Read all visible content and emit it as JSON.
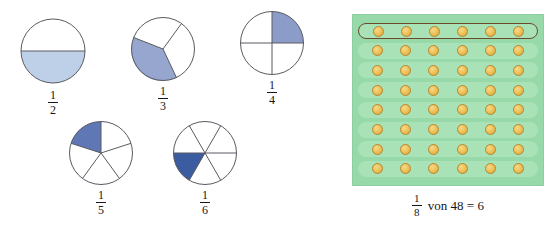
{
  "colors": {
    "fill_light_blue": "#bed0e8",
    "fill_mid_blue": "#8c9cc8",
    "fill_medium_blue": "#97a6cf",
    "fill_deep_blue": "#5f77b5",
    "fill_dark_blue": "#3b5ca0",
    "circle_stroke": "#5a5a62",
    "panel_green": "#97d9a8",
    "row_green": "#a9e2b7",
    "dot_gold": "#eec45d",
    "dot_outline": "#b8862c",
    "highlight_outline": "#6b4a2a",
    "text": "#16161a"
  },
  "fraction_circles": [
    {
      "name": "one-half",
      "numerator": "1",
      "denominator": "2",
      "parts": 2,
      "shaded_parts": 1,
      "shaded_description": "bottom half shaded",
      "fill": "#bed0e8"
    },
    {
      "name": "one-third",
      "numerator": "1",
      "denominator": "3",
      "parts": 3,
      "shaded_parts": 1,
      "shaded_description": "lower-left sector shaded",
      "fill": "#97a6cf"
    },
    {
      "name": "one-quarter",
      "numerator": "1",
      "denominator": "4",
      "parts": 4,
      "shaded_parts": 1,
      "shaded_description": "upper-right quadrant shaded",
      "fill": "#8c9cc8"
    },
    {
      "name": "one-fifth",
      "numerator": "1",
      "denominator": "5",
      "parts": 5,
      "shaded_parts": 1,
      "shaded_description": "upper-left sector shaded",
      "fill": "#5f77b5"
    },
    {
      "name": "one-sixth",
      "numerator": "1",
      "denominator": "6",
      "parts": 6,
      "shaded_parts": 1,
      "shaded_description": "left sector below horizontal shaded",
      "fill": "#3b5ca0"
    }
  ],
  "dot_grid": {
    "rows": 8,
    "columns": 6,
    "total_dots": 48,
    "highlighted_row_index": 0,
    "highlighted_row_count": 6,
    "caption": {
      "numerator": "1",
      "denominator": "8",
      "text": "von 48 = 6"
    }
  }
}
